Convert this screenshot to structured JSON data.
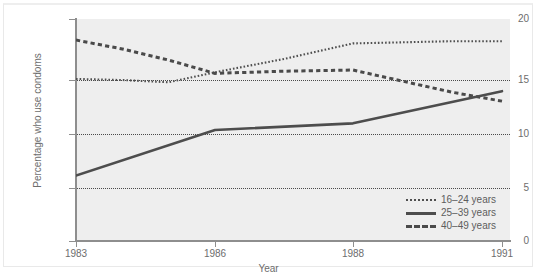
{
  "chart_data": {
    "type": "line",
    "title": "",
    "xlabel": "Year",
    "ylabel": "Percentage who use condoms",
    "xlim": [
      1983,
      1991
    ],
    "ylim": [
      0,
      20
    ],
    "yticks": [
      0,
      5,
      10,
      15,
      20
    ],
    "ytick_labels": [
      "0",
      "5",
      "10",
      "15",
      "20"
    ],
    "xticks": [
      1983,
      1986,
      1988,
      1991
    ],
    "xtick_labels": [
      "1983",
      "1986",
      "1988",
      "1991"
    ],
    "grid": "horizontal-dotted",
    "legend_position": "bottom-right",
    "series": [
      {
        "name": "16–24 years",
        "style": "dotted",
        "color": "#4f4f4f",
        "x": [
          1983,
          1984,
          1985,
          1986,
          1987,
          1988,
          1989,
          1990,
          1991
        ],
        "values": [
          14.6,
          14.5,
          14.3,
          15.2,
          16.4,
          17.8,
          17.9,
          18.0,
          18.0
        ]
      },
      {
        "name": "25–39 years",
        "style": "solid",
        "color": "#4d4d4d",
        "x": [
          1983,
          1986,
          1988,
          1991
        ],
        "values": [
          5.9,
          10.0,
          10.6,
          13.5
        ]
      },
      {
        "name": "40–49 years",
        "style": "dashed",
        "color": "#4a4a4a",
        "x": [
          1983,
          1984,
          1985,
          1986,
          1987,
          1988,
          1989,
          1990,
          1991
        ],
        "values": [
          18.1,
          17.3,
          16.3,
          15.1,
          15.3,
          15.4,
          14.4,
          13.4,
          12.6
        ]
      }
    ]
  },
  "axes": {
    "y_title": "Percentage who use condoms",
    "x_title": "Year",
    "y_labels": [
      "20",
      "15",
      "10",
      "5",
      "0"
    ],
    "x_labels": [
      "1983",
      "1986",
      "1988",
      "1991"
    ]
  },
  "legend": {
    "items": [
      {
        "label": "16–24 years",
        "style": "dotted"
      },
      {
        "label": "25–39 years",
        "style": "solid"
      },
      {
        "label": "40–49 years",
        "style": "dashed"
      }
    ]
  }
}
